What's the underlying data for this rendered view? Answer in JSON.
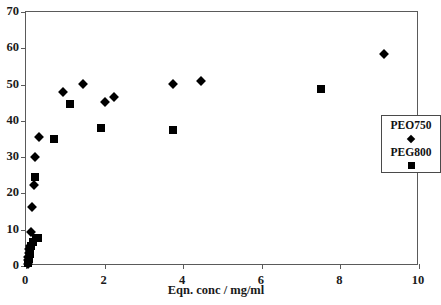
{
  "chart_data": {
    "type": "scatter",
    "title": "",
    "xlabel": "Eqn. conc / mg/ml",
    "ylabel": "",
    "xlim": [
      0,
      10
    ],
    "ylim": [
      0,
      70
    ],
    "xticks": [
      0,
      2,
      4,
      6,
      8,
      10
    ],
    "yticks": [
      0,
      10,
      20,
      30,
      40,
      50,
      60,
      70
    ],
    "grid": false,
    "legend_position": "right",
    "series": [
      {
        "name": "PEO750",
        "marker": "diamond",
        "color": "#000000",
        "points": [
          [
            0.04,
            0.6
          ],
          [
            0.05,
            1.6
          ],
          [
            0.06,
            2.6
          ],
          [
            0.07,
            3.6
          ],
          [
            0.08,
            4.6
          ],
          [
            0.1,
            5.6
          ],
          [
            0.12,
            9.4
          ],
          [
            0.16,
            16.2
          ],
          [
            0.21,
            22.3
          ],
          [
            0.22,
            30.0
          ],
          [
            0.33,
            35.6
          ],
          [
            0.95,
            48.0
          ],
          [
            1.45,
            50.2
          ],
          [
            2.0,
            45.3
          ],
          [
            2.25,
            46.6
          ],
          [
            3.75,
            50.2
          ],
          [
            4.45,
            50.9
          ],
          [
            9.1,
            58.5
          ]
        ]
      },
      {
        "name": "PEG800",
        "marker": "square",
        "color": "#000000",
        "points": [
          [
            0.06,
            0.8
          ],
          [
            0.07,
            2.0
          ],
          [
            0.09,
            3.2
          ],
          [
            0.11,
            4.4
          ],
          [
            0.13,
            5.6
          ],
          [
            0.18,
            6.6
          ],
          [
            0.26,
            7.6
          ],
          [
            0.31,
            7.8
          ],
          [
            0.23,
            24.4
          ],
          [
            0.72,
            35.0
          ],
          [
            1.12,
            44.6
          ],
          [
            1.9,
            37.9
          ],
          [
            3.75,
            37.4
          ],
          [
            7.5,
            48.9
          ]
        ]
      }
    ]
  },
  "legend": {
    "entries": [
      {
        "label": "PEO750",
        "marker": "diamond"
      },
      {
        "label": "PEG800",
        "marker": "square"
      }
    ]
  }
}
